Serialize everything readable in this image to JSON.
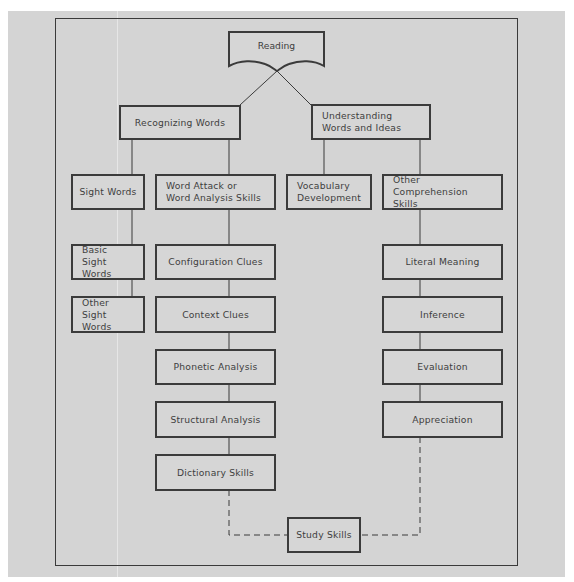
{
  "diagram": {
    "root": "Reading",
    "branches": {
      "recognizing": "Recognizing Words",
      "understanding": "Understanding Words and Ideas"
    },
    "nodes": {
      "sight_words": "Sight Words",
      "word_attack": "Word Attack or Word Analysis Skills",
      "vocabulary": "Vocabulary Development",
      "other_comprehension": "Other Comprehension Skills",
      "basic_sight": "Basic Sight Words",
      "other_sight": "Other Sight Words",
      "configuration": "Configuration Clues",
      "context": "Context Clues",
      "phonetic": "Phonetic Analysis",
      "structural": "Structural Analysis",
      "dictionary": "Dictionary Skills",
      "literal": "Literal Meaning",
      "inference": "Inference",
      "evaluation": "Evaluation",
      "appreciation": "Appreciation",
      "study": "Study Skills"
    },
    "edges": [
      {
        "from": "Reading",
        "to": "Recognizing Words",
        "style": "solid"
      },
      {
        "from": "Reading",
        "to": "Understanding Words and Ideas",
        "style": "solid"
      },
      {
        "from": "Recognizing Words",
        "to": "Sight Words",
        "style": "solid"
      },
      {
        "from": "Recognizing Words",
        "to": "Word Attack or Word Analysis Skills",
        "style": "solid"
      },
      {
        "from": "Understanding Words and Ideas",
        "to": "Vocabulary Development",
        "style": "solid"
      },
      {
        "from": "Understanding Words and Ideas",
        "to": "Other Comprehension Skills",
        "style": "solid"
      },
      {
        "from": "Sight Words",
        "to": "Basic Sight Words",
        "style": "solid"
      },
      {
        "from": "Basic Sight Words",
        "to": "Other Sight Words",
        "style": "solid"
      },
      {
        "from": "Word Attack or Word Analysis Skills",
        "to": "Configuration Clues",
        "style": "solid"
      },
      {
        "from": "Configuration Clues",
        "to": "Context Clues",
        "style": "solid"
      },
      {
        "from": "Context Clues",
        "to": "Phonetic Analysis",
        "style": "solid"
      },
      {
        "from": "Phonetic Analysis",
        "to": "Structural Analysis",
        "style": "solid"
      },
      {
        "from": "Structural Analysis",
        "to": "Dictionary Skills",
        "style": "solid"
      },
      {
        "from": "Other Comprehension Skills",
        "to": "Literal Meaning",
        "style": "solid"
      },
      {
        "from": "Literal Meaning",
        "to": "Inference",
        "style": "solid"
      },
      {
        "from": "Inference",
        "to": "Evaluation",
        "style": "solid"
      },
      {
        "from": "Evaluation",
        "to": "Appreciation",
        "style": "solid"
      },
      {
        "from": "Dictionary Skills",
        "to": "Study Skills",
        "style": "dashed"
      },
      {
        "from": "Appreciation",
        "to": "Study Skills",
        "style": "dashed"
      }
    ]
  }
}
